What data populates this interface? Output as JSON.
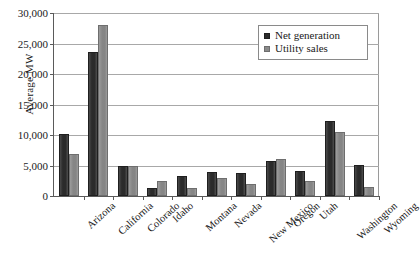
{
  "chart_data": {
    "type": "bar",
    "title": "",
    "xlabel": "",
    "ylabel": "Average MW",
    "ylim": [
      0,
      30000
    ],
    "yticks": [
      0,
      5000,
      10000,
      15000,
      20000,
      25000,
      30000
    ],
    "ytick_labels": [
      "0",
      "5,000",
      "10,000",
      "15,000",
      "20,000",
      "25,000",
      "30,000"
    ],
    "grid": true,
    "legend_position": "top-right",
    "categories": [
      "Arizona",
      "California",
      "Colorado",
      "Idaho",
      "Montana",
      "Nevada",
      "New Mexico",
      "Oregon",
      "Utah",
      "Washington",
      "Wyoming"
    ],
    "series": [
      {
        "name": "Net generation",
        "color": "#2b2b2b",
        "values": [
          10200,
          23600,
          4900,
          1300,
          3200,
          4000,
          3800,
          5700,
          4100,
          12300,
          5100
        ]
      },
      {
        "name": "Utility sales",
        "color": "#8a8a8a",
        "values": [
          6900,
          28000,
          4900,
          2500,
          1300,
          3000,
          2000,
          6000,
          2500,
          10500,
          1400
        ]
      }
    ]
  }
}
